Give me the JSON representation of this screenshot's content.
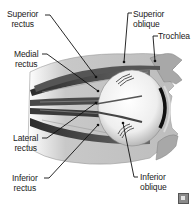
{
  "diagram": {
    "labels": [
      {
        "id": "superior-rectus",
        "line1": "Superior",
        "line2": "rectus"
      },
      {
        "id": "superior-oblique",
        "line1": "Superior",
        "line2": "oblique"
      },
      {
        "id": "trochlea",
        "line1": "Trochlea",
        "line2": ""
      },
      {
        "id": "medial-rectus",
        "line1": "Medial",
        "line2": "rectus"
      },
      {
        "id": "lateral-rectus",
        "line1": "Lateral",
        "line2": "rectus"
      },
      {
        "id": "inferior-rectus",
        "line1": "Inferior",
        "line2": "rectus"
      },
      {
        "id": "inferior-oblique",
        "line1": "Inferior",
        "line2": "oblique"
      }
    ],
    "colors": {
      "muscle_dark": "#3c3c3c",
      "muscle_mid": "#6e6e6e",
      "tissue_light": "#b8b8b8",
      "eyeball": "#f2f2f2",
      "leader_line": "#111111"
    },
    "logo": "publisher-logo-icon"
  }
}
